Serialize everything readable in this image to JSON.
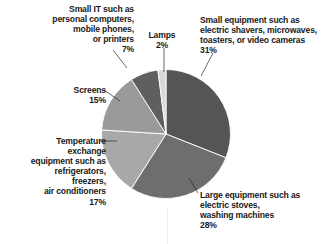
{
  "chart_data": {
    "type": "pie",
    "title": "",
    "subtitle": "",
    "xlabel": "",
    "ylabel": "",
    "legend_position": "none",
    "grid": false,
    "units": "percent",
    "start_angle_deg": 0,
    "direction": "clockwise",
    "categories": [
      "Small equipment such as electric shavers, microwaves, toasters, or video cameras",
      "Large equipment such as electric stoves, washing machines",
      "Temperature exchange equipment such as refrigerators, freezers, air conditioners",
      "Screens",
      "Small IT such as personal computers, mobile phones, or printers",
      "Lamps"
    ],
    "values": [
      31,
      28,
      17,
      15,
      7,
      2
    ],
    "colors": [
      "#555555",
      "#6e6e6e",
      "#a8a8a8",
      "#9a9a9a",
      "#5f5f5f",
      "#d8d8d8"
    ],
    "slices": [
      {
        "name": "small-equipment",
        "label": "Small equipment such as\nelectric shavers, microwaves,\ntoasters, or video cameras\n31%",
        "value": 31,
        "value_text": "31%",
        "color": "#555555"
      },
      {
        "name": "large-equipment",
        "label": "Large equipment such as\nelectric stoves,\nwashing machines\n28%",
        "value": 28,
        "value_text": "28%",
        "color": "#6e6e6e"
      },
      {
        "name": "temperature-exchange-equipment",
        "label": "Temperature\nexchange\nequipment such as\nrefrigerators,\nfreezers,\nair conditioners\n17%",
        "value": 17,
        "value_text": "17%",
        "color": "#a8a8a8"
      },
      {
        "name": "screens",
        "label": "Screens\n15%",
        "value": 15,
        "value_text": "15%",
        "color": "#9a9a9a"
      },
      {
        "name": "small-it",
        "label": "Small IT such as\npersonal computers,\nmobile phones,\nor printers\n7%",
        "value": 7,
        "value_text": "7%",
        "color": "#5f5f5f"
      },
      {
        "name": "lamps",
        "label": "Lamps\n2%",
        "value": 2,
        "value_text": "2%",
        "color": "#d8d8d8"
      }
    ]
  },
  "labels": {
    "small_it": "Small IT such as\npersonal computers,\nmobile phones,\nor printers\n7%",
    "lamps": "Lamps\n2%",
    "small_equipment": "Small equipment such as\nelectric shavers, microwaves,\ntoasters, or video cameras\n31%",
    "screens": "Screens\n15%",
    "temperature_exchange": "Temperature\nexchange\nequipment such as\nrefrigerators,\nfreezers,\nair conditioners\n17%",
    "large_equipment": "Large equipment such as\nelectric stoves,\nwashing machines\n28%"
  }
}
